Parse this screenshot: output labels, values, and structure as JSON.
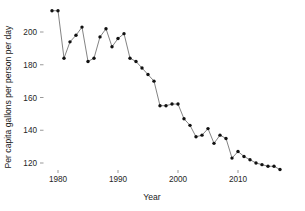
{
  "chart_data": {
    "type": "line",
    "title": "",
    "subtitle": "",
    "xlabel": "Year",
    "ylabel": "Per capita gallons per person per day",
    "xlim": [
      1978,
      2018
    ],
    "ylim": [
      112,
      216
    ],
    "grid": false,
    "legend": null,
    "legend_position": "none",
    "marker": "filled-circle",
    "line_color": "#4d4d4d",
    "marker_color": "#111111",
    "xticks": [
      1980,
      1990,
      2000,
      2010
    ],
    "xtick_labels": [
      "1980",
      "1990",
      "2000",
      "2010"
    ],
    "yticks": [
      120,
      140,
      160,
      180,
      200
    ],
    "ytick_labels": [
      "120",
      "140",
      "160",
      "180",
      "200"
    ],
    "x": [
      1979,
      1980,
      1981,
      1982,
      1983,
      1984,
      1985,
      1986,
      1987,
      1988,
      1989,
      1990,
      1991,
      1992,
      1993,
      1994,
      1995,
      1996,
      1997,
      1998,
      1999,
      2000,
      2001,
      2002,
      2003,
      2004,
      2005,
      2006,
      2007,
      2008,
      2009,
      2010,
      2011,
      2012,
      2013,
      2014,
      2015,
      2016,
      2017
    ],
    "values": [
      213,
      213,
      184,
      194,
      198,
      203,
      182,
      184,
      197,
      202,
      191,
      196,
      199,
      184,
      182,
      178,
      174,
      170,
      155,
      155,
      156,
      156,
      147,
      143,
      136,
      137,
      141,
      132,
      137,
      135,
      123,
      127,
      124,
      122,
      120,
      119,
      118,
      118,
      116
    ],
    "series": [
      {
        "name": "Per capita water use",
        "values": [
          213,
          213,
          184,
          194,
          198,
          203,
          182,
          184,
          197,
          202,
          191,
          196,
          199,
          184,
          182,
          178,
          174,
          170,
          155,
          155,
          156,
          156,
          147,
          143,
          136,
          137,
          141,
          132,
          137,
          135,
          123,
          127,
          124,
          122,
          120,
          119,
          118,
          118,
          116
        ]
      }
    ]
  }
}
